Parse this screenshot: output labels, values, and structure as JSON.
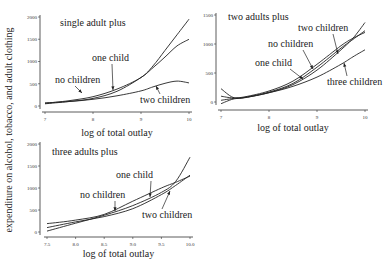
{
  "ylabel": "expenditure on alcohol, tobacco, and adult clothing",
  "chart_data": [
    {
      "type": "line",
      "title": "single adult plus",
      "xlabel": "log of total outlay",
      "ylabel": "expenditure on alcohol, tobacco, and adult clothing",
      "xlim": [
        7,
        10
      ],
      "ylim": [
        0,
        2000
      ],
      "xticks": [
        "7",
        "8",
        "9",
        "10"
      ],
      "yticks": [
        "0",
        "500",
        "1000",
        "1500",
        "2000"
      ],
      "x": [
        7.0,
        7.5,
        8.0,
        8.5,
        9.0,
        9.25,
        9.5,
        9.75,
        10.0
      ],
      "series": [
        {
          "name": "no children",
          "values": [
            60,
            120,
            210,
            380,
            640,
            900,
            1250,
            1600,
            1950
          ]
        },
        {
          "name": "one child",
          "values": [
            50,
            100,
            170,
            330,
            640,
            860,
            1100,
            1350,
            1500
          ]
        },
        {
          "name": "two children",
          "values": [
            70,
            100,
            150,
            230,
            340,
            430,
            510,
            560,
            520
          ]
        }
      ]
    },
    {
      "type": "line",
      "title": "two adults plus",
      "xlabel": "log of total outlay",
      "ylabel": "",
      "xlim": [
        7,
        10
      ],
      "ylim": [
        0,
        1500
      ],
      "xticks": [
        "7",
        "8",
        "9",
        "10"
      ],
      "yticks": [
        "0",
        "500",
        "1000",
        "1500"
      ],
      "x": [
        7.0,
        7.25,
        7.5,
        8.0,
        8.5,
        9.0,
        9.5,
        9.75,
        10.0
      ],
      "series": [
        {
          "name": "no children",
          "values": [
            100,
            70,
            90,
            190,
            360,
            650,
            970,
            1100,
            1200
          ]
        },
        {
          "name": "one child",
          "values": [
            30,
            60,
            80,
            170,
            320,
            600,
            930,
            1080,
            1230
          ]
        },
        {
          "name": "two children",
          "values": [
            -30,
            50,
            75,
            160,
            300,
            550,
            900,
            1100,
            1370
          ]
        },
        {
          "name": "three children",
          "values": [
            230,
            80,
            80,
            160,
            270,
            430,
            650,
            780,
            900
          ]
        }
      ]
    },
    {
      "type": "line",
      "title": "three adults plus",
      "xlabel": "log of total outlay",
      "ylabel": "",
      "xlim": [
        7.5,
        10.0
      ],
      "ylim": [
        0,
        2000
      ],
      "xticks": [
        "7.5",
        "8.0",
        "8.5",
        "9.0",
        "9.5",
        "10.0"
      ],
      "yticks": [
        "0",
        "500",
        "1000",
        "1500",
        "2000"
      ],
      "x": [
        7.5,
        8.0,
        8.5,
        9.0,
        9.5,
        9.75,
        10.0
      ],
      "series": [
        {
          "name": "no children",
          "values": [
            190,
            270,
            400,
            700,
            1000,
            1130,
            1270
          ]
        },
        {
          "name": "one child",
          "values": [
            20,
            200,
            380,
            600,
            900,
            1150,
            1700
          ]
        },
        {
          "name": "two children",
          "values": [
            100,
            230,
            350,
            530,
            850,
            1060,
            1290
          ]
        }
      ]
    }
  ],
  "panels": [
    {
      "title": "single adult plus",
      "xlabel": "log of total outlay",
      "labels": [
        {
          "text": "no children",
          "x": 55,
          "y": 83,
          "ax": 82,
          "ay": 93
        },
        {
          "text": "one child",
          "x": 92,
          "y": 61,
          "ax": 113,
          "ay": 90
        },
        {
          "text": "two children",
          "x": 140,
          "y": 103,
          "ax": 156,
          "ay": 86
        }
      ]
    },
    {
      "title": "two adults plus",
      "xlabel": "log of total outlay",
      "labels": [
        {
          "text": "two children",
          "x": 298,
          "y": 31,
          "ax": 338,
          "ay": 54
        },
        {
          "text": "no children",
          "x": 268,
          "y": 47,
          "ax": 313,
          "ay": 69
        },
        {
          "text": "one child",
          "x": 255,
          "y": 66,
          "ax": 303,
          "ay": 79
        },
        {
          "text": "three children",
          "x": 327,
          "y": 85,
          "ax": 344,
          "ay": 63
        }
      ]
    },
    {
      "title": "three adults plus",
      "xlabel": "log of total outlay",
      "labels": [
        {
          "text": "one child",
          "x": 116,
          "y": 178,
          "ax": 150,
          "ay": 197
        },
        {
          "text": "no children",
          "x": 80,
          "y": 198,
          "ax": 115,
          "ay": 211
        },
        {
          "text": "two children",
          "x": 142,
          "y": 218,
          "ax": 170,
          "ay": 191
        }
      ]
    }
  ]
}
